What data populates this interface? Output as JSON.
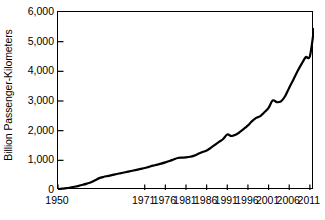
{
  "chart_data": {
    "type": "line",
    "title": "",
    "subtitle": "",
    "xlabel": "",
    "ylabel": "Billion Passenger-Kilometers",
    "xlim": [
      1950,
      2012
    ],
    "ylim": [
      0,
      6000
    ],
    "grid": false,
    "legend": null,
    "legend_position": "none",
    "line_color": "#000000",
    "background_color": "#ffffff",
    "y_ticks": [
      0,
      1000,
      2000,
      3000,
      4000,
      5000,
      6000
    ],
    "y_tick_labels": [
      "0",
      "1,000",
      "2,000",
      "3,000",
      "4,000",
      "5,000",
      "6,000"
    ],
    "x_tick_labels": [
      "1950",
      "1971",
      "1976",
      "1981",
      "1986",
      "1991",
      "1996",
      "2001",
      "2006",
      "2011"
    ],
    "x_tick_values": [
      1950,
      1971,
      1976,
      1981,
      1986,
      1991,
      1996,
      2001,
      2006,
      2011
    ],
    "series": [
      {
        "name": "World air travel",
        "x": [
          1950,
          1951,
          1952,
          1953,
          1954,
          1955,
          1956,
          1957,
          1958,
          1959,
          1960,
          1961,
          1962,
          1963,
          1964,
          1965,
          1966,
          1967,
          1968,
          1969,
          1970,
          1971,
          1972,
          1973,
          1974,
          1975,
          1976,
          1977,
          1978,
          1979,
          1980,
          1981,
          1982,
          1983,
          1984,
          1985,
          1986,
          1987,
          1988,
          1989,
          1990,
          1991,
          1992,
          1993,
          1994,
          1995,
          1996,
          1997,
          1998,
          1999,
          2000,
          2001,
          2002,
          2003,
          2004,
          2005,
          2006,
          2007,
          2008,
          2009,
          2010,
          2011,
          2012
        ],
        "y": [
          28,
          45,
          62,
          85,
          110,
          140,
          175,
          215,
          260,
          330,
          400,
          440,
          470,
          500,
          530,
          560,
          590,
          620,
          650,
          680,
          710,
          740,
          780,
          820,
          855,
          890,
          930,
          975,
          1030,
          1080,
          1090,
          1100,
          1120,
          1160,
          1220,
          1280,
          1330,
          1420,
          1520,
          1620,
          1720,
          1870,
          1820,
          1860,
          1950,
          2060,
          2180,
          2320,
          2430,
          2490,
          2620,
          2770,
          3020,
          2960,
          2990,
          3160,
          3450,
          3720,
          4000,
          4250,
          4480,
          4510,
          5430
        ],
        "color": "#000000",
        "line_width": 2.2
      }
    ],
    "annotations": [
      {
        "label": "start near zero",
        "x": 1950,
        "y": 28
      },
      {
        "label": "plateau",
        "x": 1958,
        "y": 260
      },
      {
        "label": "Gulf War dip",
        "x": 1991,
        "y": 1870
      },
      {
        "label": "2001 dip",
        "x": 2001,
        "y": 3020
      },
      {
        "label": "financial crisis plateau",
        "x": 2009,
        "y": 4480
      },
      {
        "label": "end",
        "x": 2012,
        "y": 5430
      }
    ]
  },
  "axis": {
    "y_title": "Billion Passenger-Kilometers"
  }
}
